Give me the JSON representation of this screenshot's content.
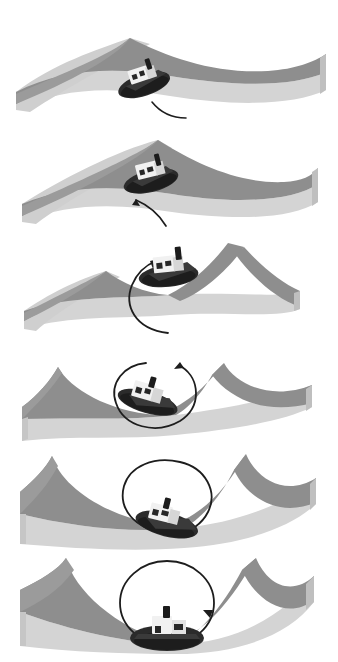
{
  "figure": {
    "panel_count": 6,
    "background_color": "#ffffff"
  },
  "palette": {
    "surface_top_dark": "#8c8c8c",
    "surface_top_mid": "#9a9a9a",
    "surface_face_light": "#c9c9c9",
    "surface_face_lighter": "#d8d8d8",
    "surface_edge_shadow": "#adadad",
    "slab_front": "#d2d2d2",
    "slab_side": "#bcbcbc",
    "hull": "#2b2b2b",
    "hull_shadow": "#1a1a1a",
    "cabin": "#f2f2f2",
    "cabin_shade": "#d0d0d0",
    "window": "#2b2b2b",
    "stack": "#1f1f1f",
    "arrow": "#1a1a1a",
    "background": "#ffffff"
  },
  "panels": [
    {
      "index": 1,
      "label": "panel-1",
      "name": "gentle-saddle-short-tail",
      "curvature": "gentle saddle, single broad ridge running from upper-left down to the right",
      "boat": {
        "position": "upper-left of centre, resting on the ridge",
        "heading": "facing lower-left",
        "view": "three-quarter from above"
      },
      "arrow": {
        "shape": "short curved tail",
        "completion_percent": 12,
        "arrowhead": "none visible",
        "description": "a short dark curve trailing down-right from the boat's stern"
      }
    },
    {
      "index": 2,
      "label": "panel-2",
      "name": "saddle-quarter-arc",
      "curvature": "saddle deepening, ridge peak shifted right of centre",
      "boat": {
        "position": "centre-left on the ridge",
        "heading": "facing lower-left",
        "view": "three-quarter from above"
      },
      "arrow": {
        "shape": "quarter arc with arrowhead pointing up at the boat",
        "completion_percent": 28,
        "arrowhead": "up, at the boat's stern",
        "description": "a curving arrow sweeping from lower-right up to the hull"
      }
    },
    {
      "index": 3,
      "label": "panel-3",
      "name": "valley-half-arc",
      "curvature": "two peaks with a valley between them, boat perched on the central crest",
      "boat": {
        "position": "centre, on the crest",
        "heading": "facing right",
        "view": "three-quarter from above"
      },
      "arrow": {
        "shape": "half circle with arrowhead at top",
        "completion_percent": 55,
        "arrowhead": "up-right, at the boat's bow",
        "description": "a large arc curving from below the boat up around its left side"
      }
    },
    {
      "index": 4,
      "label": "panel-4",
      "name": "valley-three-quarter-circle",
      "curvature": "pronounced valley, crest ridge crossing behind the boat",
      "boat": {
        "position": "centre, tilted on the slope",
        "heading": "facing lower-left, rotated",
        "view": "three-quarter from above, stern toward viewer"
      },
      "arrow": {
        "shape": "three-quarter circle with arrowhead at upper right",
        "completion_percent": 78,
        "arrowhead": "right, above the boat",
        "description": "a near-complete circle enclosing the boat"
      }
    },
    {
      "index": 5,
      "label": "panel-5",
      "name": "deep-valley-near-full-circle",
      "curvature": "deep valley, steep walls left and right",
      "boat": {
        "position": "centre-right, low in the valley",
        "heading": "facing lower-right",
        "view": "three-quarter from above"
      },
      "arrow": {
        "shape": "near-complete circle with arrowhead at lower right",
        "completion_percent": 92,
        "arrowhead": "down-right, at the boat's bow",
        "description": "a full loop drawn around the boat"
      }
    },
    {
      "index": 6,
      "label": "panel-6",
      "name": "deep-valley-full-circle",
      "curvature": "deepest valley, boat settled at the lowest point",
      "boat": {
        "position": "bottom centre of the valley",
        "heading": "facing the viewer (bow on)",
        "view": "front elevation"
      },
      "arrow": {
        "shape": "complete closed circle with arrowhead at lower right",
        "completion_percent": 100,
        "arrowhead": "down, at the boat's right rail",
        "description": "a closed circular loop around the boat"
      }
    }
  ],
  "boat": {
    "name": "tugboat",
    "parts": [
      "hull",
      "cabin",
      "cabin-windows",
      "smokestack",
      "deck"
    ]
  }
}
